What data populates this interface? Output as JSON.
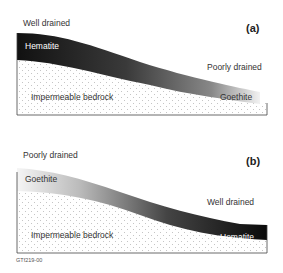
{
  "panels": [
    {
      "id_label": "(a)",
      "top_label": "Well drained",
      "right_label": "Poorly drained",
      "layer_left": "Hematite",
      "layer_right": "Goethite",
      "bedrock": "Impermeable bedrock",
      "gradient": {
        "left": "#111111",
        "right": "#f0f0f0"
      }
    },
    {
      "id_label": "(b)",
      "top_label": "Poorly drained",
      "right_label": "Well drained",
      "layer_left": "Goethite",
      "layer_right": "Hematite",
      "bedrock": "Impermeable bedrock",
      "gradient": {
        "left": "#f0f0f0",
        "right": "#111111"
      }
    }
  ],
  "figure_code": "GTf219-00"
}
